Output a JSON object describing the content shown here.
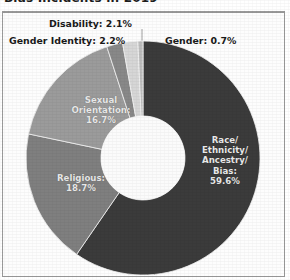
{
  "title": {
    "text": "Bias Incidents in 2019",
    "clipped": true
  },
  "chart_data": {
    "type": "pie",
    "variant": "doughnut",
    "title": "Bias Incidents in 2019",
    "xlabel": "",
    "ylabel": "",
    "grid": false,
    "legend_position": "none",
    "labels_outside_small_slices": true,
    "categories": [
      "Race/Ethnicity/Ancestry/Bias",
      "Religious",
      "Sexual Orientation",
      "Gender Identity",
      "Disability",
      "Gender"
    ],
    "values": [
      59.6,
      18.7,
      16.7,
      2.2,
      2.1,
      0.7
    ],
    "units": "percent",
    "total": 100.0,
    "colors": [
      "#3b3b3b",
      "#7f7f7f",
      "#9b9b9b",
      "#888888",
      "#d6d6d6",
      "#bdbdbd"
    ],
    "slices": [
      {
        "name": "Race/Ethnicity/Ancestry/Bias",
        "value": 59.6,
        "label": "Race/\nEthnicity/\nAncestry/\nBias:\n59.6%",
        "label_line1": "Race/",
        "label_line2": "Ethnicity/",
        "label_line3": "Ancestry/",
        "label_line4": "Bias:",
        "label_line5": "59.6%",
        "color": "#3b3b3b",
        "label_placement": "inside"
      },
      {
        "name": "Religious",
        "value": 18.7,
        "label_line1": "Religious:",
        "label_line2": "18.7%",
        "color": "#7f7f7f",
        "label_placement": "inside"
      },
      {
        "name": "Sexual Orientation",
        "value": 16.7,
        "label_line1": "Sexual",
        "label_line2": "Orientation:",
        "label_line3": "16.7%",
        "color": "#9b9b9b",
        "label_placement": "inside"
      },
      {
        "name": "Gender Identity",
        "value": 2.2,
        "label": "Gender Identity: 2.2%",
        "color": "#888888",
        "label_placement": "outside"
      },
      {
        "name": "Disability",
        "value": 2.1,
        "label": "Disability: 2.1%",
        "color": "#d6d6d6",
        "label_placement": "outside"
      },
      {
        "name": "Gender",
        "value": 0.7,
        "label": "Gender: 0.7%",
        "color": "#bdbdbd",
        "label_placement": "outside"
      }
    ]
  }
}
